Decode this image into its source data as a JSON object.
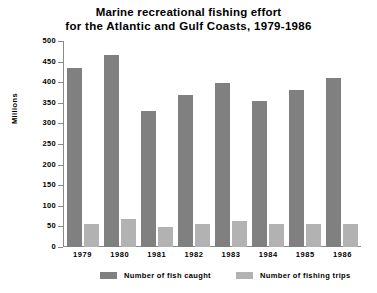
{
  "chart_data": {
    "type": "bar",
    "title": "Marine recreational fishing effort for the Atlantic and Gulf Coasts, 1979-1986",
    "title_lines": [
      "Marine recreational fishing effort",
      "for the Atlantic and Gulf Coasts, 1979-1986"
    ],
    "xlabel": "",
    "ylabel": "Millions",
    "ylim": [
      0,
      500
    ],
    "ytick_step": 50,
    "yticks": [
      500,
      450,
      400,
      350,
      300,
      250,
      200,
      150,
      100,
      50,
      0
    ],
    "categories": [
      "1979",
      "1980",
      "1981",
      "1982",
      "1983",
      "1984",
      "1985",
      "1986"
    ],
    "grid": false,
    "legend_position": "bottom",
    "series": [
      {
        "name": "Number of fish caught",
        "color": "#808080",
        "values": [
          435,
          465,
          330,
          370,
          397,
          355,
          380,
          410
        ]
      },
      {
        "name": "Number of fishing trips",
        "color": "#b2b2b2",
        "values": [
          57,
          67,
          49,
          55,
          63,
          57,
          56,
          57
        ]
      }
    ]
  },
  "legend": {
    "items": [
      {
        "label": "Number of fish caught",
        "color": "#808080"
      },
      {
        "label": "Number of fishing trips",
        "color": "#b2b2b2"
      }
    ]
  },
  "colors": {
    "fish_caught": "#808080",
    "fishing_trips": "#b2b2b2",
    "axis": "#8a8a8a",
    "text": "#000000",
    "background": "#ffffff"
  }
}
